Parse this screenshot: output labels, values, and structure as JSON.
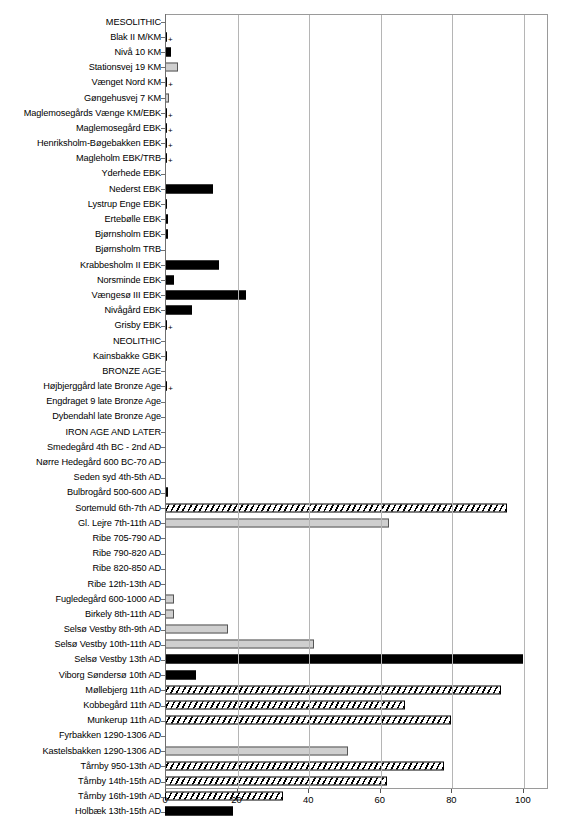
{
  "chart_data": {
    "type": "bar",
    "orientation": "horizontal",
    "title": "",
    "xlabel": "",
    "ylabel": "",
    "xlim": [
      0,
      107
    ],
    "ylim": null,
    "grid": true,
    "legend": null,
    "xticks": [
      0,
      20,
      40,
      60,
      80,
      100
    ],
    "xticklabels": [
      "0",
      "20",
      "40",
      "60",
      "80",
      "100"
    ],
    "categories": [
      "MESOLITHIC",
      "Blak II M/KM",
      "Nivå 10 KM",
      "Stationsvej 19 KM",
      "Vænget Nord KM",
      "Gøngehusvej 7 KM",
      "Maglemosegårds Vænge KM/EBK",
      "Maglemosegård EBK",
      "Henriksholm-Bøgebakken EBK",
      "Magleholm EBK/TRB",
      "Yderhede EBK",
      "Nederst EBK",
      "Lystrup Enge EBK",
      "Ertebølle EBK",
      "Bjørnsholm EBK",
      "Bjørnsholm TRB",
      "Krabbesholm II EBK",
      "Norsminde EBK",
      "Vængesø III EBK",
      "Nivågård EBK",
      "Grisby EBK",
      "NEOLITHIC",
      "Kainsbakke GBK",
      "BRONZE AGE",
      "Højbjerggård late Bronze Age",
      "Engdraget 9 late Bronze Age",
      "Dybendahl late Bronze Age",
      "IRON AGE AND LATER",
      "Smedegård 4th BC - 2nd AD",
      "Nørre Hedegård 600 BC-70 AD",
      "Seden syd 4th-5th AD",
      "Bulbrogård 500-600 AD",
      "Sortemuld 6th-7th AD",
      "Gl. Lejre 7th-11th AD",
      "Ribe 705-790 AD",
      "Ribe 790-820 AD",
      "Ribe 820-850 AD",
      "Ribe 12th-13th AD",
      "Fugledegård 600-1000 AD",
      "Birkely 8th-11th AD",
      "Selsø Vestby 8th-9th AD",
      "Selsø Vestby 10th-11th AD",
      "Selsø Vestby 13th AD",
      "Viborg Søndersø 10th AD",
      "Møllebjerg 11th AD",
      "Kobbegård 11th AD",
      "Munkerup 11th AD",
      "Fyrbakken 1290-1306 AD",
      "Kastelsbakken 1290-1306 AD",
      "Tårnby 950-13th AD",
      "Tårnby 14th-15th AD",
      "Tårnby 16th-19th AD",
      "Holbæk 13th-15th AD"
    ],
    "values": [
      null,
      0.4,
      1.6,
      3.6,
      0.5,
      1.1,
      0.4,
      0.4,
      0.4,
      0.4,
      0,
      13.5,
      0.6,
      0.9,
      0.7,
      0,
      15.0,
      2.6,
      22.6,
      7.5,
      0.4,
      null,
      0.6,
      null,
      0.5,
      0,
      0,
      null,
      0,
      0,
      0,
      0.9,
      95.5,
      62.5,
      0,
      0,
      0,
      0,
      2.6,
      2.5,
      17.6,
      41.5,
      100.0,
      8.6,
      94.0,
      67.0,
      80.0,
      0,
      51.0,
      78.0,
      62.0,
      33.0,
      19.0
    ],
    "styles": [
      "none",
      "solid",
      "solid",
      "gray",
      "solid",
      "gray",
      "solid",
      "solid",
      "solid",
      "solid",
      "none",
      "solid",
      "solid",
      "solid",
      "solid",
      "none",
      "solid",
      "solid",
      "solid",
      "solid",
      "solid",
      "none",
      "solid",
      "none",
      "solid",
      "none",
      "none",
      "none",
      "none",
      "none",
      "none",
      "solid",
      "hatch",
      "gray",
      "none",
      "none",
      "none",
      "none",
      "gray",
      "gray",
      "gray",
      "gray",
      "solid",
      "solid",
      "hatch",
      "hatch",
      "hatch",
      "none",
      "gray",
      "hatch",
      "hatch",
      "hatch",
      "solid"
    ],
    "plus_markers": [
      false,
      true,
      false,
      false,
      true,
      false,
      true,
      true,
      true,
      true,
      false,
      false,
      false,
      false,
      false,
      false,
      false,
      false,
      false,
      false,
      true,
      false,
      false,
      false,
      true,
      false,
      false,
      false,
      false,
      false,
      false,
      false,
      false,
      false,
      false,
      false,
      false,
      false,
      false,
      false,
      false,
      false,
      false,
      false,
      false,
      false,
      false,
      false,
      false,
      false,
      false,
      false,
      false
    ],
    "group_headers": [
      "MESOLITHIC",
      "NEOLITHIC",
      "BRONZE AGE",
      "IRON AGE AND LATER"
    ],
    "plus_symbol": "+"
  }
}
